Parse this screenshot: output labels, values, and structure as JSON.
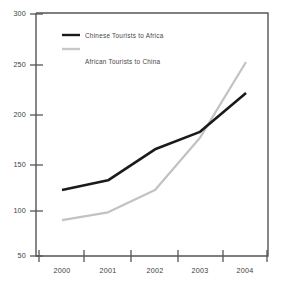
{
  "chart_data": {
    "type": "line",
    "title": "",
    "xlabel": "",
    "ylabel": "",
    "categories": [
      "2000",
      "2001",
      "2002",
      "2003",
      "2004"
    ],
    "x": [
      2000,
      2001,
      2002,
      2003,
      2004
    ],
    "series": [
      {
        "name": "Chinese Tourists to Africa",
        "color": "#1a1a1a",
        "values": [
          118,
          128,
          160,
          178,
          218
        ]
      },
      {
        "name": "African Tourists to China",
        "color": "#c2c2c2",
        "values": [
          87,
          95,
          118,
          172,
          250
        ]
      }
    ],
    "ylim": [
      50,
      300
    ],
    "yticks": [
      50,
      100,
      150,
      200,
      250,
      300
    ],
    "ytick_labels": [
      "50",
      "100",
      "150",
      "200",
      "250",
      "300"
    ],
    "xtick_labels": [
      "2000",
      "2001",
      "2002",
      "2003",
      "2004"
    ],
    "grid": false,
    "legend_position": "top-left"
  },
  "axes": {
    "y_labels": [
      "300",
      "250",
      "200",
      "150",
      "100",
      "50"
    ],
    "x_labels": [
      "2000",
      "2001",
      "2002",
      "2003",
      "2004"
    ]
  },
  "legend": {
    "entries": [
      {
        "label": "Chinese Tourists to Africa",
        "swatch_color": "#1a1a1a"
      },
      {
        "label": "African Tourists to China",
        "swatch_color": "#c8c8c8"
      }
    ]
  }
}
